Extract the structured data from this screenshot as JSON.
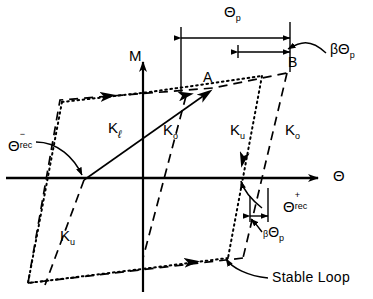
{
  "figure": {
    "type": "moment-rotation-hysteresis-diagram",
    "axes": {
      "y_label": "M",
      "x_label": "Θ",
      "origin_px": [
        143,
        178
      ]
    },
    "points": {
      "A": "A",
      "B": "B"
    },
    "stiffness_labels": [
      {
        "id": "k-l",
        "base": "K",
        "sub": "ℓ"
      },
      {
        "id": "k-o-1",
        "base": "K",
        "sub": "o"
      },
      {
        "id": "k-u-1",
        "base": "K",
        "sub": "u"
      },
      {
        "id": "k-o-2",
        "base": "K",
        "sub": "o"
      },
      {
        "id": "k-u-2",
        "base": "K",
        "sub": "u"
      }
    ],
    "dimensions": {
      "theta_p": {
        "base": "Θ",
        "sub": "p"
      },
      "beta_theta_p": {
        "beta": "β",
        "base": "Θ",
        "sub": "p"
      },
      "beta_theta_p_lower": {
        "beta": "β",
        "base": "Θ",
        "sub": "p"
      }
    },
    "recoverable": {
      "negative": {
        "base": "Θ",
        "sup": "−",
        "sub": "rec"
      },
      "positive": {
        "base": "Θ",
        "sup": "+",
        "sub": "rec"
      }
    },
    "annotations": {
      "stable_loop": "Stable Loop"
    },
    "colors": {
      "ink": "#000000",
      "background": "#ffffff"
    }
  }
}
